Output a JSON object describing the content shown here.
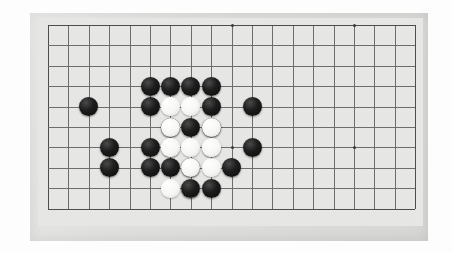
{
  "scene": {
    "title": "Go board position (goban close-up photo)",
    "background_color": "#fdfdfd"
  },
  "board": {
    "name": "go-board",
    "slab_color": "#dfdfdd",
    "surface_color": "#e6e6e4",
    "line_color": "#6d6d6d",
    "edge_line_color": "#4d4d4d",
    "slab": {
      "x": 30,
      "y": 13,
      "width": 398,
      "height": 228
    },
    "surface": {
      "x": 38,
      "y": 18,
      "width": 385,
      "height": 208
    },
    "grid": {
      "origin_x": 48,
      "origin_y": 25,
      "spacing": 20.4,
      "columns": 19,
      "rows": 10,
      "visible_column_count": 19,
      "visible_row_count": 10
    },
    "star_points": [
      {
        "col": 9,
        "row": 0
      },
      {
        "col": 15,
        "row": 0
      },
      {
        "col": 9,
        "row": 6
      },
      {
        "col": 15,
        "row": 6
      }
    ],
    "stone_diameter": 19,
    "stone_colors": {
      "black": "#141414",
      "white": "#f7f7f5"
    },
    "stones": [
      {
        "color": "black",
        "col": 5,
        "row": 4
      },
      {
        "color": "black",
        "col": 5,
        "row": 6
      },
      {
        "color": "black",
        "col": 5,
        "row": 7
      },
      {
        "color": "black",
        "col": 6,
        "row": 5
      },
      {
        "color": "black",
        "col": 6,
        "row": 7
      },
      {
        "color": "black",
        "col": 7,
        "row": 5
      },
      {
        "color": "black",
        "col": 7,
        "row": 7
      },
      {
        "color": "black",
        "col": 8,
        "row": 5
      },
      {
        "color": "white",
        "col": 6,
        "row": 6
      },
      {
        "color": "white",
        "col": 7,
        "row": 6
      },
      {
        "color": "white",
        "col": 8,
        "row": 6
      },
      {
        "color": "white",
        "col": 8,
        "row": 7
      },
      {
        "color": "white",
        "col": 7,
        "row": 8
      },
      {
        "color": "black",
        "col": 5,
        "row": 3
      },
      {
        "color": "black",
        "col": 6,
        "row": 3
      },
      {
        "color": "black",
        "col": 7,
        "row": 3
      },
      {
        "color": "black",
        "col": 8,
        "row": 3
      },
      {
        "color": "white",
        "col": 6,
        "row": 4
      },
      {
        "color": "white",
        "col": 7,
        "row": 4
      },
      {
        "color": "black",
        "col": 8,
        "row": 4
      },
      {
        "color": "white",
        "col": 6,
        "row": 5
      },
      {
        "color": "white",
        "col": 8,
        "row": 5
      },
      {
        "color": "white",
        "col": 6,
        "row": 6
      },
      {
        "color": "white",
        "col": 8,
        "row": 6
      },
      {
        "color": "white",
        "col": 7,
        "row": 7
      },
      {
        "color": "white",
        "col": 6,
        "row": 8
      },
      {
        "color": "black",
        "col": 7,
        "row": 8
      },
      {
        "color": "black",
        "col": 8,
        "row": 8
      },
      {
        "color": "black",
        "col": 10,
        "row": 4
      },
      {
        "color": "black",
        "col": 10,
        "row": 6
      },
      {
        "color": "black",
        "col": 9,
        "row": 7
      },
      {
        "color": "black",
        "col": 3,
        "row": 6
      },
      {
        "color": "black",
        "col": 3,
        "row": 7
      },
      {
        "color": "black",
        "col": 2,
        "row": 4
      }
    ]
  }
}
